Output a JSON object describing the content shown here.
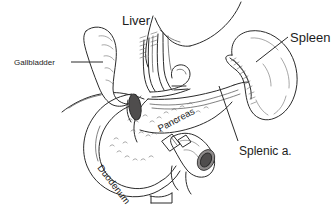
{
  "figure": {
    "background_color": "#ffffff",
    "ink_color": "#2b2b2b",
    "width": 334,
    "height": 210
  },
  "labels": {
    "liver": "Liver",
    "gallbladder": "Gallbladder",
    "spleen": "Spleen",
    "splenic_artery": "Splenic a.",
    "pancreas": "Pancreas",
    "duodenum": "Duodenum"
  },
  "structures": [
    {
      "name": "liver",
      "label": "Liver"
    },
    {
      "name": "gallbladder",
      "label": "Gallbladder"
    },
    {
      "name": "spleen",
      "label": "Spleen"
    },
    {
      "name": "splenic-artery",
      "label": "Splenic a."
    },
    {
      "name": "pancreas",
      "label": "Pancreas"
    },
    {
      "name": "duodenum",
      "label": "Duodenum"
    }
  ]
}
